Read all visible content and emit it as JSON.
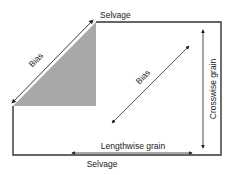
{
  "diagram": {
    "colors": {
      "line": "#333333",
      "bias_fill": "#a8a8a8",
      "text": "#222222",
      "background": "#ffffff"
    },
    "labels": {
      "selvage_top": "Selvage",
      "selvage_bottom": "Selvage",
      "bias_left": "Bias",
      "bias_center": "Bias",
      "crosswise": "Crosswise grain",
      "lengthwise": "Lengthwise grain"
    },
    "arrows": [
      {
        "name": "bias-left-arrow",
        "direction": "diagonal, double-headed"
      },
      {
        "name": "bias-center-arrow",
        "direction": "diagonal, double-headed"
      },
      {
        "name": "crosswise-grain-arrow",
        "direction": "vertical, double-headed"
      },
      {
        "name": "lengthwise-grain-arrow",
        "direction": "horizontal, double-headed"
      }
    ]
  }
}
